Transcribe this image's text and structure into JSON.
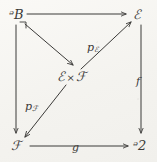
{
  "diagram": {
    "background_color": "#f4f3ef",
    "ink_color": "#3b3a38",
    "width": 157,
    "height": 162,
    "nodes": [
      {
        "id": "P",
        "label": "ᵊB",
        "text": "P",
        "position": "top-left"
      },
      {
        "id": "E",
        "label": "ℰ",
        "text": "E",
        "position": "top-right"
      },
      {
        "id": "ExF",
        "label_left": "ℰ",
        "times": "×",
        "label_right": "ℱ",
        "position": "center"
      },
      {
        "id": "F",
        "label": "ℱ",
        "text": "F",
        "position": "bottom-left"
      },
      {
        "id": "G",
        "label": "ᵊ2",
        "text": "G",
        "position": "bottom-right"
      }
    ],
    "edges": [
      {
        "id": "P-to-E",
        "from": "P",
        "to": "E",
        "label": "",
        "style": "solid-arrow",
        "direction": "right"
      },
      {
        "id": "P-to-F",
        "from": "P",
        "to": "F",
        "label": "",
        "style": "solid-arrow",
        "direction": "down"
      },
      {
        "id": "E-to-G",
        "from": "E",
        "to": "G",
        "label": "f",
        "style": "solid-arrow",
        "direction": "down"
      },
      {
        "id": "F-to-G",
        "from": "F",
        "to": "G",
        "label": "g",
        "style": "solid-arrow",
        "direction": "right"
      },
      {
        "id": "P-to-ExF",
        "from": "P",
        "to": "ExF",
        "label": "",
        "style": "solid-arrow",
        "direction": "down-right"
      },
      {
        "id": "ExF-to-E",
        "from": "ExF",
        "to": "E",
        "label": "p",
        "sublabel": "ℰ",
        "style": "solid-arrow",
        "direction": "up-right"
      },
      {
        "id": "ExF-to-F",
        "from": "ExF",
        "to": "F",
        "label": "p",
        "sublabel": "ℱ",
        "style": "solid-arrow",
        "direction": "down-left"
      }
    ],
    "markers": [
      {
        "id": "pullback-corner",
        "at": "P",
        "symbol": "right-angle"
      }
    ],
    "labels": {
      "f": "f",
      "g": "g",
      "p_E_base": "p",
      "p_E_sub": "ℰ",
      "p_F_base": "p",
      "p_F_sub": "ℱ",
      "P": "ᵊB",
      "E": "ℰ",
      "F": "ℱ",
      "G": "ᵊ2",
      "times": "×"
    }
  }
}
